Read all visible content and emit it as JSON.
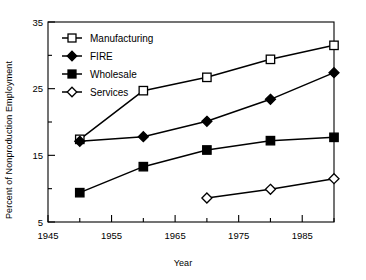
{
  "chart_data": {
    "type": "line",
    "title": "",
    "xlabel": "Year",
    "ylabel": "Percent of Nonproduction Employment",
    "xlim": [
      1945,
      1990
    ],
    "ylim": [
      5,
      35
    ],
    "xticks": [
      1945,
      1955,
      1965,
      1975,
      1985
    ],
    "xticklabels": [
      "1945",
      "1955",
      "1965",
      "1975",
      "1985"
    ],
    "xminorticks": [
      1950,
      1960,
      1970,
      1980,
      1990
    ],
    "yticks": [
      5,
      15,
      25,
      35
    ],
    "yticklabels": [
      "5",
      "15",
      "25",
      "35"
    ],
    "yminorticks": [
      10,
      20,
      30
    ],
    "grid": false,
    "legend_position": "upper left",
    "x": [
      1950,
      1960,
      1970,
      1980,
      1990
    ],
    "series": [
      {
        "name": "Manufacturing",
        "marker": "open-square",
        "x": [
          1950,
          1960,
          1970,
          1980,
          1990
        ],
        "values": [
          17.4,
          24.7,
          26.7,
          29.4,
          31.5
        ]
      },
      {
        "name": "FIRE",
        "marker": "filled-diamond",
        "x": [
          1950,
          1960,
          1970,
          1980,
          1990
        ],
        "values": [
          17.1,
          17.8,
          20.1,
          23.4,
          27.4
        ]
      },
      {
        "name": "Wholesale",
        "marker": "filled-square",
        "x": [
          1950,
          1960,
          1970,
          1980,
          1990
        ],
        "values": [
          9.4,
          13.3,
          15.8,
          17.2,
          17.7
        ]
      },
      {
        "name": "Services",
        "marker": "open-diamond",
        "x": [
          1970,
          1980,
          1990
        ],
        "values": [
          8.6,
          9.9,
          11.5
        ]
      }
    ]
  },
  "legend": {
    "entries": [
      {
        "label": "Manufacturing"
      },
      {
        "label": "FIRE"
      },
      {
        "label": "Wholesale"
      },
      {
        "label": "Services"
      }
    ]
  },
  "colors": {
    "line": "#000000",
    "marker_fill_open": "#ffffff",
    "marker_fill_solid": "#000000",
    "axis": "#000000",
    "background": "#ffffff"
  }
}
